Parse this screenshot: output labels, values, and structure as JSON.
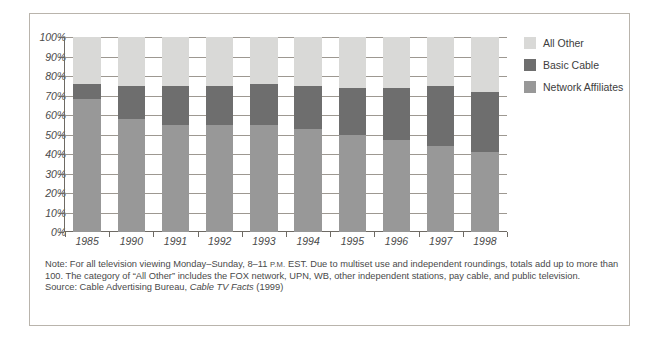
{
  "chart_data": {
    "type": "bar",
    "subtype": "100% stacked column",
    "title": "",
    "xlabel": "",
    "ylabel": "",
    "ylim": [
      0,
      100
    ],
    "ytick_labels": [
      "100%",
      "90%",
      "80%",
      "70%",
      "60%",
      "50%",
      "40%",
      "30%",
      "20%",
      "10%",
      "0%"
    ],
    "ytick_values": [
      100,
      90,
      80,
      70,
      60,
      50,
      40,
      30,
      20,
      10,
      0
    ],
    "grid": true,
    "legend_position": "right",
    "categories": [
      "1985",
      "1990",
      "1991",
      "1992",
      "1993",
      "1994",
      "1995",
      "1996",
      "1997",
      "1998"
    ],
    "series": [
      {
        "name": "Network Affiliates",
        "color": "#989898",
        "values": [
          68,
          58,
          55,
          55,
          55,
          53,
          50,
          47,
          44,
          41
        ]
      },
      {
        "name": "Basic Cable",
        "color": "#6e6e6e",
        "values": [
          8,
          17,
          20,
          20,
          21,
          22,
          24,
          27,
          31,
          31
        ]
      },
      {
        "name": "All Other",
        "color": "#d9d9d7",
        "values": [
          24,
          25,
          25,
          25,
          24,
          25,
          26,
          26,
          25,
          28
        ]
      }
    ],
    "cumulative_tops": {
      "network_affiliates": [
        68,
        58,
        55,
        55,
        55,
        53,
        50,
        47,
        44,
        41
      ],
      "basic_cable": [
        76,
        75,
        75,
        75,
        76,
        75,
        74,
        74,
        75,
        72
      ],
      "all_other": [
        100,
        100,
        100,
        100,
        100,
        100,
        100,
        100,
        100,
        100
      ]
    }
  },
  "legend": {
    "items": [
      {
        "label": "All Other",
        "color": "#d9d9d7"
      },
      {
        "label": "Basic Cable",
        "color": "#6e6e6e"
      },
      {
        "label": "Network Affiliates",
        "color": "#989898"
      }
    ]
  },
  "notes": {
    "note_prefix": "Note: For all television viewing Monday–Sunday, 8–11 ",
    "note_smallcaps": "P.M.",
    "note_body": " EST. Due to multiset use and independent roundings, totals add up to more than 100. The category of “All Other” includes the FOX network, UPN, WB, other independent stations, pay cable, and public television.",
    "source_prefix": "Source: Cable Advertising Bureau, ",
    "source_italic": "Cable TV Facts",
    "source_suffix": " (1999)"
  }
}
